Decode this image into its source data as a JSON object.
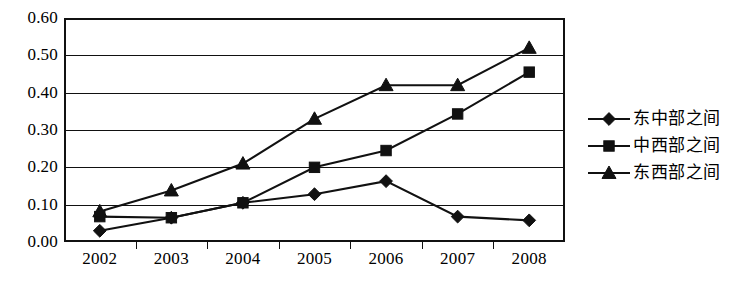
{
  "chart_data": {
    "type": "line",
    "title": "",
    "xlabel": "",
    "ylabel": "",
    "categories": [
      "2002",
      "2003",
      "2004",
      "2005",
      "2006",
      "2007",
      "2008"
    ],
    "ylim": [
      0.0,
      0.6
    ],
    "yticks": [
      "0.00",
      "0.10",
      "0.20",
      "0.30",
      "0.40",
      "0.50",
      "0.60"
    ],
    "ytick_values": [
      0.0,
      0.1,
      0.2,
      0.3,
      0.4,
      0.5,
      0.6
    ],
    "grid": true,
    "legend_position": "right",
    "series": [
      {
        "name": "东中部之间",
        "marker": "diamond",
        "values": [
          0.03,
          0.065,
          0.105,
          0.128,
          0.163,
          0.068,
          0.058
        ]
      },
      {
        "name": "中西部之间",
        "marker": "square",
        "values": [
          0.068,
          0.065,
          0.105,
          0.2,
          0.245,
          0.343,
          0.455
        ]
      },
      {
        "name": "东西部之间",
        "marker": "triangle",
        "values": [
          0.082,
          0.138,
          0.21,
          0.33,
          0.42,
          0.42,
          0.52
        ]
      }
    ]
  },
  "legend": {
    "items": [
      {
        "label": "东中部之间",
        "marker": "diamond"
      },
      {
        "label": "中西部之间",
        "marker": "square"
      },
      {
        "label": "东西部之间",
        "marker": "triangle"
      }
    ]
  },
  "colors": {
    "line": "#111111",
    "marker": "#111111",
    "grid": "#111111",
    "frame": "#111111",
    "background": "#ffffff"
  }
}
